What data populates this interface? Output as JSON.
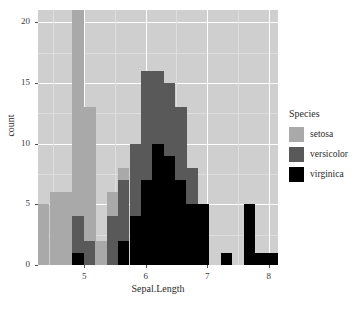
{
  "chart_data": {
    "type": "bar",
    "subtype": "stacked-histogram",
    "title": "",
    "xlabel": "Sepal.Length",
    "ylabel": "count",
    "xlim": [
      4.25,
      8.15
    ],
    "ylim": [
      0,
      21
    ],
    "xticks": [
      5,
      6,
      7,
      8
    ],
    "yticks": [
      0,
      5,
      10,
      15,
      20
    ],
    "xtick_labels": [
      "5",
      "6",
      "7",
      "8"
    ],
    "ytick_labels": [
      "0",
      "5",
      "10",
      "15",
      "20"
    ],
    "grid": true,
    "legend_position": "right",
    "legend_title": "Species",
    "bin_width": 0.1857,
    "bin_starts": [
      4.25,
      4.44,
      4.62,
      4.81,
      5.0,
      5.18,
      5.37,
      5.55,
      5.74,
      5.92,
      6.11,
      6.29,
      6.48,
      6.66,
      6.85,
      7.04,
      7.22,
      7.41,
      7.59,
      7.78,
      7.96
    ],
    "categories": [
      "4.3",
      "4.5",
      "4.7",
      "4.9",
      "5.1",
      "5.3",
      "5.4",
      "5.6",
      "5.8",
      "6.0",
      "6.2",
      "6.4",
      "6.5",
      "6.7",
      "6.9",
      "7.1",
      "7.3",
      "7.5",
      "7.7",
      "7.9",
      "8.0"
    ],
    "series": [
      {
        "name": "setosa",
        "color": "#a9a9a9",
        "values": [
          5,
          6,
          6,
          17,
          11,
          2,
          2,
          1,
          0,
          0,
          0,
          0,
          0,
          0,
          0,
          0,
          0,
          0,
          0,
          0,
          0
        ]
      },
      {
        "name": "versicolor",
        "color": "#595959",
        "values": [
          0,
          0,
          0,
          3,
          2,
          0,
          4,
          5,
          6,
          9,
          6,
          6,
          6,
          3,
          0,
          0,
          0,
          0,
          0,
          0,
          0
        ]
      },
      {
        "name": "virginica",
        "color": "#000000",
        "values": [
          0,
          0,
          0,
          1,
          0,
          0,
          0,
          2,
          4,
          7,
          10,
          9,
          7,
          5,
          5,
          0,
          1,
          0,
          5,
          1,
          1
        ]
      }
    ],
    "stack_totals": [
      5,
      6,
      6,
      21,
      13,
      2,
      6,
      8,
      10,
      16,
      16,
      15,
      13,
      8,
      5,
      0,
      1,
      0,
      5,
      1,
      1
    ]
  },
  "axis": {
    "x_title": "Sepal.Length",
    "y_title": "count"
  },
  "legend": {
    "title": "Species",
    "items": [
      {
        "label": "setosa",
        "color": "#a9a9a9"
      },
      {
        "label": "versicolor",
        "color": "#595959"
      },
      {
        "label": "virginica",
        "color": "#000000"
      }
    ]
  },
  "theme": {
    "panel_background": "#cfcfcf",
    "gridline_major": "#ffffff",
    "gridline_minor": "#dedede",
    "page_background": "#ffffff",
    "text_color": "#2b2b2b"
  }
}
